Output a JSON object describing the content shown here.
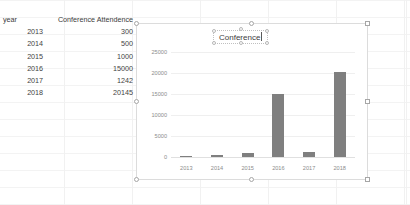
{
  "app": {
    "context": "spreadsheet-with-embedded-chart"
  },
  "sheet": {
    "table": {
      "headers": [
        "year",
        "Conference Attendence"
      ],
      "rows": [
        {
          "year": "2013",
          "attendance": "300"
        },
        {
          "year": "2014",
          "attendance": "500"
        },
        {
          "year": "2015",
          "attendance": "1000"
        },
        {
          "year": "2016",
          "attendance": "15000"
        },
        {
          "year": "2017",
          "attendance": "1242"
        },
        {
          "year": "2018",
          "attendance": "20145"
        }
      ]
    }
  },
  "chart": {
    "title_text": "Conference",
    "title_editing": true,
    "selected": true,
    "colors": {
      "bar": "#7f7f7f",
      "gridline": "#efefef",
      "axis_text": "#8c8c8c",
      "frame": "#dcdcdc"
    }
  },
  "chart_data": {
    "type": "bar",
    "title": "Conference",
    "categories": [
      "2013",
      "2014",
      "2015",
      "2016",
      "2017",
      "2018"
    ],
    "values": [
      300,
      500,
      1000,
      15000,
      1242,
      20145
    ],
    "series": [
      {
        "name": "Conference Attendence",
        "values": [
          300,
          500,
          1000,
          15000,
          1242,
          20145
        ]
      }
    ],
    "xlabel": "",
    "ylabel": "",
    "ylim": [
      0,
      25000
    ],
    "yticks": [
      0,
      5000,
      10000,
      15000,
      20000,
      25000
    ],
    "ytick_labels": [
      "0",
      "5000",
      "10000",
      "15000",
      "20000",
      "25000"
    ],
    "grid": true,
    "legend": false
  }
}
